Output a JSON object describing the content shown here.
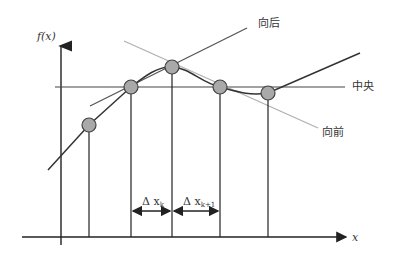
{
  "diagram": {
    "y_axis_label": "f(x)",
    "x_axis_label": "x",
    "labels": {
      "backward": "向后",
      "central": "中央",
      "forward": "向前",
      "delta_k": "Δx_k",
      "delta_k_text": "Δ x",
      "delta_k_sub": "k",
      "delta_k1_text": "Δ x",
      "delta_k1_sub": "k+1"
    },
    "colors": {
      "curve": "#333333",
      "point_fill": "#a9a9a9",
      "point_stroke": "#444444",
      "forward_line": "#b0b0b0",
      "backward_line": "#555555",
      "central_line": "#444444"
    },
    "points": [
      {
        "x": 89,
        "y": 125
      },
      {
        "x": 131,
        "y": 87
      },
      {
        "x": 172,
        "y": 67
      },
      {
        "x": 220,
        "y": 87
      },
      {
        "x": 268,
        "y": 93
      }
    ]
  }
}
